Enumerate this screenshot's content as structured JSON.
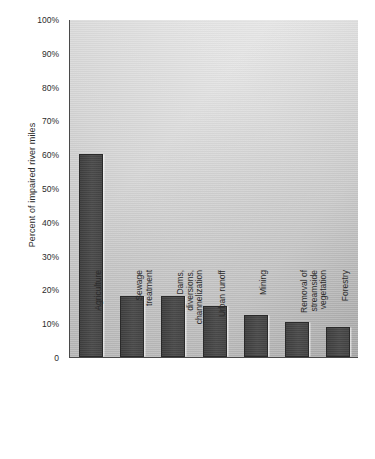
{
  "chart_data": {
    "type": "bar",
    "title": "",
    "subtitle": "",
    "xlabel": "",
    "ylabel": "Percent of impaired river miles",
    "ylim": [
      0,
      100
    ],
    "grid": false,
    "legend": "none",
    "y_tick_labels": [
      "100%",
      "90%",
      "80%",
      "70%",
      "60%",
      "50%",
      "40%",
      "30%",
      "20%",
      "10%",
      "0"
    ],
    "y_tick_values": [
      100,
      90,
      80,
      70,
      60,
      50,
      40,
      30,
      20,
      10,
      0
    ],
    "categories": [
      "Agriculture",
      "Sewage\ntreatment",
      "Dams,\ndiversions,\nchannelization",
      "Urban runoff",
      "Mining",
      "Removal of\nstreamside\nvegetation",
      "Forestry"
    ],
    "values": [
      60,
      18,
      18,
      15,
      12.5,
      10.5,
      9
    ],
    "colors": {
      "bar_fill": "#474747",
      "bar_edge": "#2a2a2a",
      "axis": "#4a4a4a",
      "text": "#2b2b2b",
      "plot_background_light": "#e8e8e8",
      "plot_background_dark": "#b9b9b9",
      "page_background": "#ffffff"
    }
  }
}
